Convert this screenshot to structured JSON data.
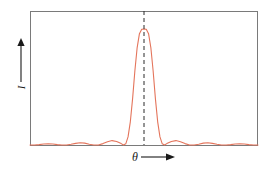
{
  "figure": {
    "name": "diffraction-intensity-pattern",
    "frame": {
      "x": 30,
      "y": 11,
      "width": 228,
      "height": 135,
      "border_color": "#7a7a7a"
    }
  },
  "axes": {
    "y": {
      "label": "I",
      "arrow_direction": "up",
      "arrow_icon": "arrow-up-icon"
    },
    "x": {
      "label": "θ",
      "arrow_direction": "right",
      "arrow_icon": "arrow-right-icon"
    }
  },
  "colors": {
    "curve": "#e4755c",
    "frame": "#7a7a7a",
    "baseline": "#7a7a7a",
    "center_line": "#2b2b2b",
    "background": "#ffffff"
  },
  "center_line": {
    "style": "dashed",
    "at_theta": 0,
    "from_top": true
  },
  "chart_data": {
    "type": "line",
    "title": "",
    "xlabel": "θ",
    "ylabel": "I",
    "xlim": [
      -1,
      1
    ],
    "ylim": [
      0,
      1
    ],
    "grid": false,
    "legend": "none",
    "annotations": [
      {
        "text": "central maximum",
        "x": 0,
        "y": 1
      }
    ],
    "series": [
      {
        "name": "Intensity",
        "color": "#e4755c",
        "x": [
          -1.0,
          -0.96,
          -0.92,
          -0.88,
          -0.84,
          -0.8,
          -0.76,
          -0.72,
          -0.68,
          -0.64,
          -0.6,
          -0.56,
          -0.52,
          -0.48,
          -0.44,
          -0.4,
          -0.36,
          -0.32,
          -0.28,
          -0.24,
          -0.2,
          -0.18,
          -0.16,
          -0.14,
          -0.12,
          -0.1,
          -0.08,
          -0.06,
          -0.04,
          -0.02,
          0.0,
          0.02,
          0.04,
          0.06,
          0.08,
          0.1,
          0.12,
          0.14,
          0.16,
          0.18,
          0.2,
          0.24,
          0.28,
          0.32,
          0.36,
          0.4,
          0.44,
          0.48,
          0.52,
          0.56,
          0.6,
          0.64,
          0.68,
          0.72,
          0.76,
          0.8,
          0.84,
          0.88,
          0.92,
          0.96,
          1.0
        ],
        "y": [
          0.0,
          0.0,
          0.003,
          0.008,
          0.01,
          0.008,
          0.003,
          0.0,
          0.0,
          0.006,
          0.014,
          0.02,
          0.016,
          0.007,
          0.0,
          0.0,
          0.012,
          0.028,
          0.038,
          0.03,
          0.012,
          0.0,
          0.01,
          0.07,
          0.2,
          0.4,
          0.64,
          0.84,
          0.96,
          0.998,
          1.0,
          0.998,
          0.96,
          0.84,
          0.64,
          0.4,
          0.2,
          0.07,
          0.01,
          0.0,
          0.012,
          0.03,
          0.038,
          0.028,
          0.012,
          0.0,
          0.0,
          0.007,
          0.016,
          0.02,
          0.014,
          0.006,
          0.0,
          0.0,
          0.003,
          0.008,
          0.01,
          0.008,
          0.003,
          0.0,
          0.0
        ]
      }
    ],
    "peaks": {
      "central": {
        "theta": 0.0,
        "intensity": 1.0
      },
      "side_lobes": [
        {
          "theta": -0.28,
          "intensity": 0.038
        },
        {
          "theta": 0.28,
          "intensity": 0.038
        },
        {
          "theta": -0.56,
          "intensity": 0.02
        },
        {
          "theta": 0.56,
          "intensity": 0.02
        },
        {
          "theta": -0.84,
          "intensity": 0.01
        },
        {
          "theta": 0.84,
          "intensity": 0.01
        }
      ]
    }
  }
}
